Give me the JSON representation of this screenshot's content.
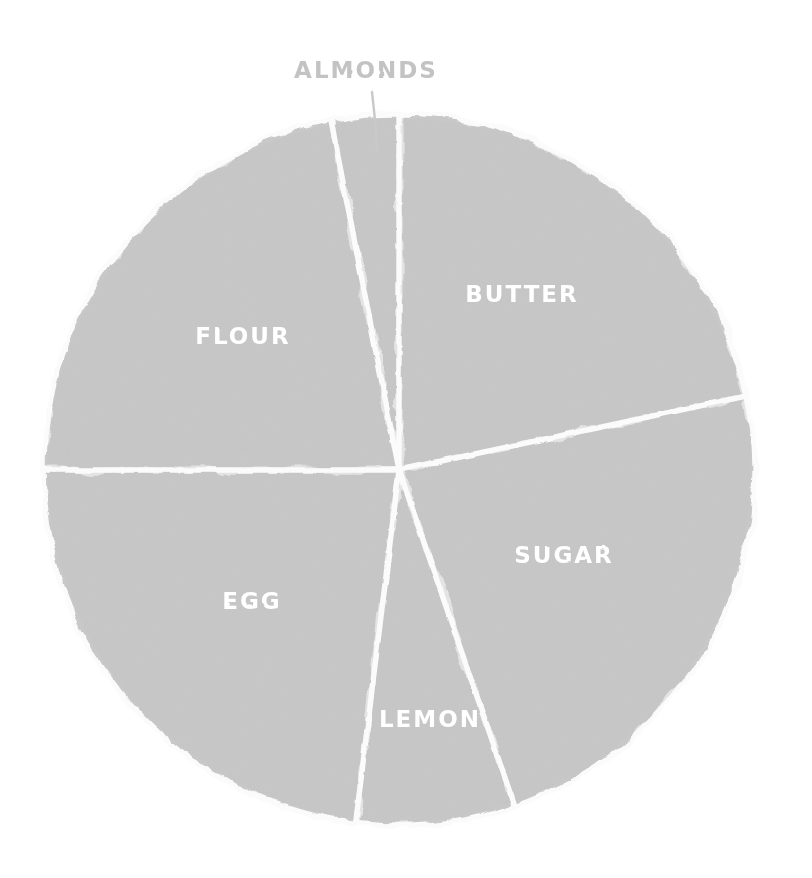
{
  "chart_data": {
    "type": "pie",
    "title": "",
    "subtitle": "",
    "xlabel": "",
    "ylabel": "",
    "legend_position": "none",
    "grid": false,
    "style": "hand-drawn marker sketch on white paper",
    "total_degrees": 360,
    "center": {
      "x": 399,
      "y": 470
    },
    "radius": 356,
    "start_angle_deg": -11,
    "direction": "clockwise",
    "categories": [
      "ALMONDS",
      "BUTTER",
      "SUGAR",
      "LEMON",
      "EGG",
      "FLOUR"
    ],
    "values": [
      11,
      78,
      83,
      26,
      83,
      79
    ],
    "value_unit": "degrees",
    "percentages": [
      3.1,
      21.7,
      23.1,
      7.2,
      23.1,
      21.9
    ],
    "slices": [
      {
        "label": "ALMONDS",
        "degrees": 11,
        "percent": 3.1,
        "start_deg": -11,
        "end_deg": 0,
        "label_placement": "callout",
        "label_x": 366,
        "label_y": 78,
        "leader_from_x": 372,
        "leader_from_y": 92,
        "leader_to_x": 377,
        "leader_to_y": 152,
        "fill": "#c8c8c8"
      },
      {
        "label": "BUTTER",
        "degrees": 78,
        "percent": 21.7,
        "start_deg": 0,
        "end_deg": 78,
        "label_placement": "inside",
        "label_x": 522,
        "label_y": 302,
        "fill": "#c8c8c8"
      },
      {
        "label": "SUGAR",
        "degrees": 83,
        "percent": 23.1,
        "start_deg": 78,
        "end_deg": 161,
        "label_placement": "inside",
        "label_x": 564,
        "label_y": 563,
        "fill": "#c8c8c8"
      },
      {
        "label": "LEMON",
        "degrees": 26,
        "percent": 7.2,
        "start_deg": 161,
        "end_deg": 187,
        "label_placement": "inside",
        "label_x": 430,
        "label_y": 727,
        "fill": "#c8c8c8"
      },
      {
        "label": "EGG",
        "degrees": 83,
        "percent": 23.1,
        "start_deg": 187,
        "end_deg": 270,
        "label_placement": "inside",
        "label_x": 252,
        "label_y": 609,
        "fill": "#c8c8c8"
      },
      {
        "label": "FLOUR",
        "degrees": 79,
        "percent": 21.9,
        "start_deg": 270,
        "end_deg": 349,
        "label_placement": "inside",
        "label_x": 243,
        "label_y": 344,
        "fill": "#c8c8c8"
      }
    ],
    "colors": {
      "slice_fill": "#c8c8c8",
      "slice_divider": "#fbfbfb",
      "inside_label": "#ffffff",
      "callout_label": "#c3c3c3",
      "leader_line": "#c9c9c9",
      "background": "#ffffff"
    }
  }
}
